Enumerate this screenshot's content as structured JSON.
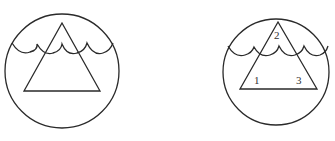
{
  "figures": [
    {
      "id": "left",
      "description": "Circle containing a triangle (mountain) with a wavy water line across upper portion",
      "labels": []
    },
    {
      "id": "right",
      "description": "Circle containing a triangle with numbered regions and a wavy water line",
      "labels": [
        {
          "text": "2",
          "position": "apex"
        },
        {
          "text": "1",
          "position": "bottom-left"
        },
        {
          "text": "3",
          "position": "bottom-right"
        }
      ]
    }
  ],
  "colors": {
    "stroke": "#2a2a2a",
    "background": "#ffffff"
  }
}
